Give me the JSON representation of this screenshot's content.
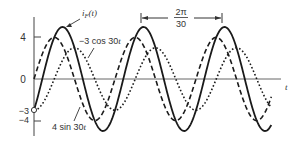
{
  "chart_data": {
    "type": "line",
    "title": "",
    "xlabel": "t",
    "ylabel": "",
    "yticks": [
      "4",
      "0",
      "-3",
      "-4"
    ],
    "ytick_values": [
      4,
      0,
      -3,
      -4
    ],
    "ylim": [
      -5.2,
      5.8
    ],
    "grid": false,
    "legend": "inline annotations",
    "omega": 30,
    "t_range_periods": [
      0,
      2.93
    ],
    "series": [
      {
        "name": "i_F(t)",
        "label": "iF(t)",
        "style": "solid",
        "expression": "4 sin 30t - 3 cos 30t",
        "amplitude": 5,
        "phase_rad": -0.6435,
        "value_at_0": -3
      },
      {
        "name": "-3 cos 30t",
        "label": "-3 cos 30t",
        "style": "dotted",
        "expression": "-3 cos 30t",
        "amplitude": 3,
        "phase_rad": -1.5708,
        "value_at_0": -3
      },
      {
        "name": "4 sin 30t",
        "label": "4 sin 30t",
        "style": "dashed",
        "expression": "4 sin 30t",
        "amplitude": 4,
        "phase_rad": 0,
        "value_at_0": 0
      }
    ],
    "annotations": [
      {
        "text": "2π/30",
        "numerator": "2π",
        "denominator": "30",
        "meaning": "period marker between successive peaks of i_F(t)"
      },
      {
        "text": "iF(t)",
        "target": "solid curve peak"
      },
      {
        "text": "-3 cos 30t",
        "target": "dotted curve"
      },
      {
        "text": "4 sin 30t",
        "target": "dashed curve"
      }
    ],
    "marker": {
      "at_t": 0,
      "value": -3,
      "shape": "open-circle"
    }
  },
  "labels": {
    "y4": "4",
    "y0": "0",
    "yneg3": "−3",
    "yneg4": "−4",
    "t": "t",
    "iF_main": "i",
    "iF_sub": "F",
    "iF_rest": "(t)",
    "cos_label": "−3 cos 30",
    "cos_t": "t",
    "sin_label": "4 sin 30",
    "sin_t": "t",
    "period_num": "2π",
    "period_den": "30"
  }
}
